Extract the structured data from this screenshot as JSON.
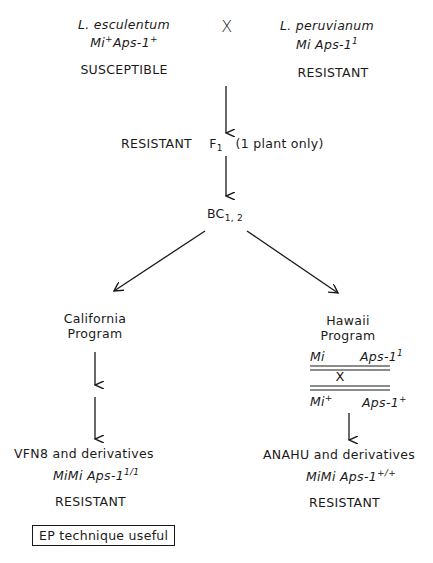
{
  "parents": {
    "female": {
      "species": "L. esculentum",
      "genotype_base": "Mi",
      "genotype_sup1": "+",
      "genotype_mid": "Aps-1",
      "genotype_sup2": "+",
      "phenotype": "SUSCEPTIBLE"
    },
    "cross_symbol": "X",
    "male": {
      "species": "L. peruvianum",
      "genotype_base": "Mi Aps-1",
      "genotype_sup": "1",
      "phenotype": "RESISTANT"
    }
  },
  "f1": {
    "label": "RESISTANT",
    "generation": "F",
    "generation_sub": "1",
    "note": "(1 plant only)"
  },
  "backcross": {
    "label": "BC",
    "sub": "1, 2"
  },
  "california": {
    "title_line1": "California",
    "title_line2": "Program",
    "result": "VFN8 and derivatives",
    "genotype": "MiMi Aps-1",
    "genotype_sup": "1/1",
    "phenotype": "RESISTANT",
    "note_box": "EP technique useful"
  },
  "hawaii": {
    "title_line1": "Hawaii",
    "title_line2": "Program",
    "chrom_top_left": "Mi",
    "chrom_top_right": "Aps-1",
    "chrom_top_right_sup": "1",
    "crossover_symbol": "X",
    "chrom_bottom_left": "Mi",
    "chrom_bottom_left_sup": "+",
    "chrom_bottom_right": "Aps-1",
    "chrom_bottom_right_sup": "+",
    "result": "ANAHU and derivatives",
    "genotype": "MiMi Aps-1",
    "genotype_sup": "+/+",
    "phenotype": "RESISTANT"
  }
}
